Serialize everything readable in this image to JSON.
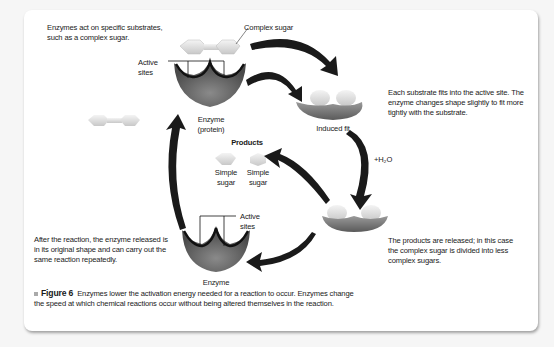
{
  "figure": {
    "number_label": "Figure 6",
    "caption": "Enzymes lower the activation energy needed for a reaction to occur. Enzymes change the speed at which chemical reactions occur without being altered themselves in the reaction."
  },
  "annotations": {
    "substrates_note": "Enzymes act on specific substrates, such as a complex sugar.",
    "induced_fit_note": "Each substrate fits into the active site. The enzyme changes shape slightly to fit more tightly with the substrate.",
    "products_note": "The products are released; in this case the complex sugar is divided into less complex sugars.",
    "reuse_note": "After the reaction, the enzyme released is in its original shape and can carry out the same reaction repeatedly."
  },
  "labels": {
    "complex_sugar": "Complex sugar",
    "active_sites_top": "Active sites",
    "enzyme_protein": "Enzyme (protein)",
    "induced_fit": "Induced fit",
    "water": "+H₂O",
    "products": "Products",
    "simple_sugar_1": "Simple sugar",
    "simple_sugar_2": "Simple sugar",
    "active_sites_bottom": "Active sites",
    "enzyme": "Enzyme"
  },
  "colors": {
    "enzyme": "#6e6e6e",
    "sugar": "#e8e8e8",
    "arrow": "#1a1a1a",
    "panel": "#ffffff"
  }
}
